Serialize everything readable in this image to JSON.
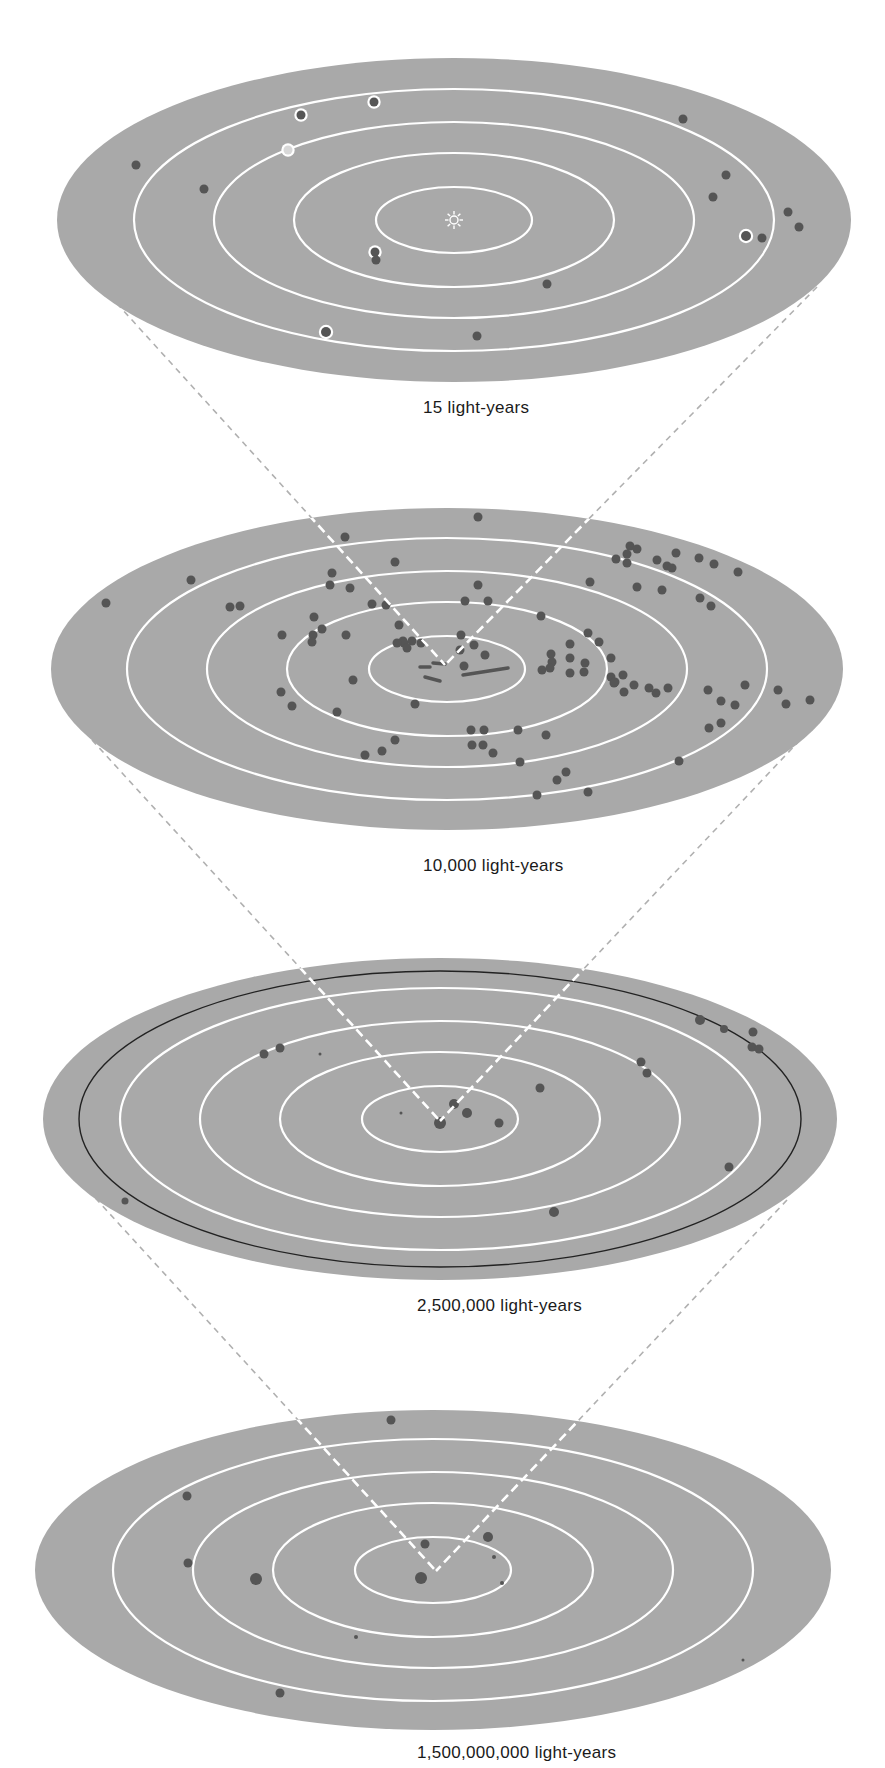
{
  "figure": {
    "type": "nested-scale diagram",
    "colors": {
      "background": "#ffffff",
      "disk": "#a9a9a9",
      "ring": "#ffffff",
      "dot": "#555555",
      "connector_outside": "#b0b0b0",
      "connector_inside": "#ffffff",
      "black_ring": "#222222"
    },
    "panels": [
      {
        "id": "local-stars",
        "label": "15 light-years",
        "label_pos": {
          "x": 423,
          "y": 398
        },
        "ellipse": {
          "cx": 454,
          "cy": 220,
          "rx": 397,
          "ry": 162
        },
        "rings": [
          {
            "rx": 78,
            "ry": 33
          },
          {
            "rx": 160,
            "ry": 67
          },
          {
            "rx": 240,
            "ry": 98
          },
          {
            "rx": 320,
            "ry": 131
          }
        ],
        "center_marker": "sun-icon",
        "dots": [
          {
            "x": 301,
            "y": 115,
            "r": 4.5,
            "ring": true
          },
          {
            "x": 374,
            "y": 102,
            "r": 4.5,
            "ring": true
          },
          {
            "x": 288,
            "y": 150,
            "r": 4.5,
            "ring": true,
            "hollow": true
          },
          {
            "x": 136,
            "y": 165,
            "r": 4.5
          },
          {
            "x": 204,
            "y": 189,
            "r": 4.5
          },
          {
            "x": 683,
            "y": 119,
            "r": 4.5
          },
          {
            "x": 726,
            "y": 175,
            "r": 4.5
          },
          {
            "x": 713,
            "y": 197,
            "r": 4.5
          },
          {
            "x": 788,
            "y": 212,
            "r": 4.5
          },
          {
            "x": 799,
            "y": 227,
            "r": 4.5
          },
          {
            "x": 746,
            "y": 236,
            "r": 5,
            "ring": true
          },
          {
            "x": 762,
            "y": 238,
            "r": 4.5
          },
          {
            "x": 375,
            "y": 252,
            "r": 4.5,
            "ring": true
          },
          {
            "x": 376,
            "y": 260,
            "r": 4.5
          },
          {
            "x": 547,
            "y": 284,
            "r": 4.5
          },
          {
            "x": 326,
            "y": 332,
            "r": 5,
            "ring": true
          },
          {
            "x": 477,
            "y": 336,
            "r": 4.5
          }
        ]
      },
      {
        "id": "milky-way-neighborhood",
        "label": "10,000 light-years",
        "label_pos": {
          "x": 423,
          "y": 856
        },
        "ellipse": {
          "cx": 447,
          "cy": 669,
          "rx": 396,
          "ry": 161
        },
        "rings": [
          {
            "rx": 78,
            "ry": 33
          },
          {
            "rx": 160,
            "ry": 67
          },
          {
            "rx": 240,
            "ry": 98
          },
          {
            "rx": 320,
            "ry": 131
          }
        ],
        "dots": [
          {
            "x": 478,
            "y": 517
          },
          {
            "x": 345,
            "y": 537
          },
          {
            "x": 395,
            "y": 562
          },
          {
            "x": 191,
            "y": 580
          },
          {
            "x": 106,
            "y": 603
          },
          {
            "x": 230,
            "y": 607
          },
          {
            "x": 240,
            "y": 606
          },
          {
            "x": 332,
            "y": 573
          },
          {
            "x": 330,
            "y": 585
          },
          {
            "x": 350,
            "y": 588
          },
          {
            "x": 478,
            "y": 585
          },
          {
            "x": 465,
            "y": 601
          },
          {
            "x": 488,
            "y": 601
          },
          {
            "x": 372,
            "y": 604
          },
          {
            "x": 386,
            "y": 605
          },
          {
            "x": 314,
            "y": 617
          },
          {
            "x": 322,
            "y": 629
          },
          {
            "x": 282,
            "y": 635
          },
          {
            "x": 313,
            "y": 635
          },
          {
            "x": 346,
            "y": 635
          },
          {
            "x": 312,
            "y": 642
          },
          {
            "x": 399,
            "y": 625
          },
          {
            "x": 403,
            "y": 641
          },
          {
            "x": 404,
            "y": 643
          },
          {
            "x": 397,
            "y": 643
          },
          {
            "x": 412,
            "y": 641
          },
          {
            "x": 421,
            "y": 643
          },
          {
            "x": 407,
            "y": 648
          },
          {
            "x": 461,
            "y": 635
          },
          {
            "x": 474,
            "y": 645
          },
          {
            "x": 460,
            "y": 650
          },
          {
            "x": 464,
            "y": 666
          },
          {
            "x": 485,
            "y": 655
          },
          {
            "x": 541,
            "y": 616
          },
          {
            "x": 588,
            "y": 633
          },
          {
            "x": 599,
            "y": 642
          },
          {
            "x": 551,
            "y": 654
          },
          {
            "x": 570,
            "y": 644
          },
          {
            "x": 552,
            "y": 662
          },
          {
            "x": 570,
            "y": 658
          },
          {
            "x": 542,
            "y": 670
          },
          {
            "x": 550,
            "y": 668
          },
          {
            "x": 570,
            "y": 673
          },
          {
            "x": 585,
            "y": 663
          },
          {
            "x": 611,
            "y": 658
          },
          {
            "x": 584,
            "y": 672
          },
          {
            "x": 611,
            "y": 677
          },
          {
            "x": 623,
            "y": 675
          },
          {
            "x": 614,
            "y": 683
          },
          {
            "x": 624,
            "y": 692
          },
          {
            "x": 615,
            "y": 682
          },
          {
            "x": 634,
            "y": 685
          },
          {
            "x": 649,
            "y": 688
          },
          {
            "x": 656,
            "y": 693
          },
          {
            "x": 668,
            "y": 688
          },
          {
            "x": 353,
            "y": 680
          },
          {
            "x": 281,
            "y": 692
          },
          {
            "x": 292,
            "y": 706
          },
          {
            "x": 337,
            "y": 712
          },
          {
            "x": 415,
            "y": 704
          },
          {
            "x": 471,
            "y": 730
          },
          {
            "x": 484,
            "y": 730
          },
          {
            "x": 518,
            "y": 730
          },
          {
            "x": 546,
            "y": 735
          },
          {
            "x": 472,
            "y": 745
          },
          {
            "x": 483,
            "y": 745
          },
          {
            "x": 493,
            "y": 753
          },
          {
            "x": 395,
            "y": 740
          },
          {
            "x": 382,
            "y": 751
          },
          {
            "x": 365,
            "y": 755
          },
          {
            "x": 520,
            "y": 762
          },
          {
            "x": 557,
            "y": 780
          },
          {
            "x": 566,
            "y": 772
          },
          {
            "x": 537,
            "y": 795
          },
          {
            "x": 588,
            "y": 792
          },
          {
            "x": 679,
            "y": 761
          },
          {
            "x": 708,
            "y": 690
          },
          {
            "x": 721,
            "y": 701
          },
          {
            "x": 735,
            "y": 705
          },
          {
            "x": 745,
            "y": 685
          },
          {
            "x": 778,
            "y": 690
          },
          {
            "x": 786,
            "y": 704
          },
          {
            "x": 810,
            "y": 700
          },
          {
            "x": 709,
            "y": 728
          },
          {
            "x": 721,
            "y": 723
          },
          {
            "x": 630,
            "y": 546
          },
          {
            "x": 627,
            "y": 554
          },
          {
            "x": 637,
            "y": 549
          },
          {
            "x": 616,
            "y": 559
          },
          {
            "x": 627,
            "y": 563
          },
          {
            "x": 657,
            "y": 560
          },
          {
            "x": 667,
            "y": 566
          },
          {
            "x": 676,
            "y": 553
          },
          {
            "x": 672,
            "y": 568
          },
          {
            "x": 699,
            "y": 558
          },
          {
            "x": 714,
            "y": 564
          },
          {
            "x": 738,
            "y": 572
          },
          {
            "x": 590,
            "y": 582
          },
          {
            "x": 637,
            "y": 587
          },
          {
            "x": 662,
            "y": 590
          },
          {
            "x": 700,
            "y": 598
          },
          {
            "x": 711,
            "y": 606
          }
        ],
        "streaks": [
          {
            "x1": 463,
            "y1": 675,
            "x2": 508,
            "y2": 668
          },
          {
            "x1": 425,
            "y1": 677,
            "x2": 440,
            "y2": 681
          },
          {
            "x1": 420,
            "y1": 667,
            "x2": 430,
            "y2": 667
          },
          {
            "x1": 433,
            "y1": 663,
            "x2": 445,
            "y2": 664
          }
        ]
      },
      {
        "id": "local-group",
        "label": "2,500,000 light-years",
        "label_pos": {
          "x": 417,
          "y": 1296
        },
        "ellipse": {
          "cx": 440,
          "cy": 1119,
          "rx": 397,
          "ry": 161
        },
        "rings": [
          {
            "rx": 78,
            "ry": 33
          },
          {
            "rx": 160,
            "ry": 67
          },
          {
            "rx": 240,
            "ry": 98
          },
          {
            "rx": 320,
            "ry": 131
          }
        ],
        "black_ring": {
          "rx": 361,
          "ry": 148
        },
        "dots": [
          {
            "x": 264,
            "y": 1054,
            "r": 4.5
          },
          {
            "x": 280,
            "y": 1048,
            "r": 4.5
          },
          {
            "x": 320,
            "y": 1054,
            "r": 1.5
          },
          {
            "x": 540,
            "y": 1088,
            "r": 4.5
          },
          {
            "x": 641,
            "y": 1062,
            "r": 4.5
          },
          {
            "x": 647,
            "y": 1073,
            "r": 4.5
          },
          {
            "x": 700,
            "y": 1020,
            "r": 5
          },
          {
            "x": 724,
            "y": 1029,
            "r": 4
          },
          {
            "x": 753,
            "y": 1032,
            "r": 4.5
          },
          {
            "x": 752,
            "y": 1047,
            "r": 4.5
          },
          {
            "x": 759,
            "y": 1049,
            "r": 4.5
          },
          {
            "x": 454,
            "y": 1104,
            "r": 5
          },
          {
            "x": 467,
            "y": 1113,
            "r": 5
          },
          {
            "x": 499,
            "y": 1123,
            "r": 4.5
          },
          {
            "x": 401,
            "y": 1113,
            "r": 1.5
          },
          {
            "x": 440,
            "y": 1123,
            "r": 6
          },
          {
            "x": 729,
            "y": 1167,
            "r": 4.5
          },
          {
            "x": 125,
            "y": 1201,
            "r": 3.5
          },
          {
            "x": 554,
            "y": 1212,
            "r": 5
          }
        ]
      },
      {
        "id": "universe-large-scale",
        "label": "1,500,000,000 light-years",
        "label_pos": {
          "x": 417,
          "y": 1743
        },
        "ellipse": {
          "cx": 433,
          "cy": 1570,
          "rx": 398,
          "ry": 160
        },
        "rings": [
          {
            "rx": 78,
            "ry": 33
          },
          {
            "rx": 160,
            "ry": 67
          },
          {
            "rx": 240,
            "ry": 98
          },
          {
            "rx": 320,
            "ry": 131
          }
        ],
        "dots": [
          {
            "x": 391,
            "y": 1420,
            "r": 4.5
          },
          {
            "x": 187,
            "y": 1496,
            "r": 4.5
          },
          {
            "x": 188,
            "y": 1563,
            "r": 4.5
          },
          {
            "x": 256,
            "y": 1579,
            "r": 6
          },
          {
            "x": 425,
            "y": 1544,
            "r": 4.5
          },
          {
            "x": 488,
            "y": 1537,
            "r": 5
          },
          {
            "x": 494,
            "y": 1557,
            "r": 2
          },
          {
            "x": 421,
            "y": 1578,
            "r": 6
          },
          {
            "x": 502,
            "y": 1583,
            "r": 2
          },
          {
            "x": 356,
            "y": 1637,
            "r": 2
          },
          {
            "x": 280,
            "y": 1693,
            "r": 4.5
          },
          {
            "x": 743,
            "y": 1660,
            "r": 1.5
          }
        ]
      }
    ],
    "connectors": [
      {
        "from_panel": 0,
        "to_panel": 1,
        "left": {
          "x1": 102,
          "y1": 287,
          "x2": 445,
          "y2": 665
        },
        "right": {
          "x1": 817,
          "y1": 287,
          "x2": 445,
          "y2": 665
        }
      },
      {
        "from_panel": 1,
        "to_panel": 2,
        "left": {
          "x1": 92,
          "y1": 740,
          "x2": 440,
          "y2": 1121
        },
        "right": {
          "x1": 800,
          "y1": 740,
          "x2": 440,
          "y2": 1121
        }
      },
      {
        "from_panel": 2,
        "to_panel": 3,
        "left": {
          "x1": 88,
          "y1": 1190,
          "x2": 436,
          "y2": 1571
        },
        "right": {
          "x1": 787,
          "y1": 1200,
          "x2": 436,
          "y2": 1571
        }
      }
    ]
  }
}
